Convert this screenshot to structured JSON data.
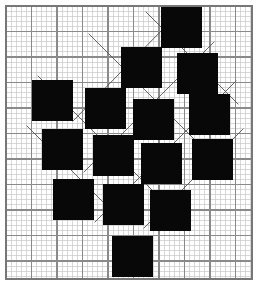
{
  "figure": {
    "width": 260,
    "height": 287,
    "background_color": "#ffffff"
  },
  "paper": {
    "name": "graph-paper",
    "left": 6,
    "top": 6,
    "right": 252,
    "bottom": 279,
    "minor_step": 5.1,
    "major_step": 25.5,
    "minor_color": "#c8c8c8",
    "major_color": "#8a8a8a",
    "border_color": "#777777",
    "minor_width": 0.7,
    "major_width": 1.1,
    "border_width": 1.2
  },
  "squares": {
    "name": "black-square",
    "fill_color": "#080808",
    "size": 41,
    "rotation_deg": 0,
    "count": 15,
    "items": [
      {
        "id": "sq-1",
        "x": 161,
        "y": 7,
        "size": 41
      },
      {
        "id": "sq-2",
        "x": 121,
        "y": 47,
        "size": 41
      },
      {
        "id": "sq-3",
        "x": 177,
        "y": 53,
        "size": 41
      },
      {
        "id": "sq-4",
        "x": 32,
        "y": 80,
        "size": 41
      },
      {
        "id": "sq-5",
        "x": 85,
        "y": 88,
        "size": 41
      },
      {
        "id": "sq-6",
        "x": 133,
        "y": 99,
        "size": 41
      },
      {
        "id": "sq-7",
        "x": 189,
        "y": 94,
        "size": 41
      },
      {
        "id": "sq-8",
        "x": 42,
        "y": 129,
        "size": 41
      },
      {
        "id": "sq-9",
        "x": 93,
        "y": 135,
        "size": 41
      },
      {
        "id": "sq-10",
        "x": 141,
        "y": 143,
        "size": 41
      },
      {
        "id": "sq-11",
        "x": 192,
        "y": 139,
        "size": 41
      },
      {
        "id": "sq-12",
        "x": 53,
        "y": 179,
        "size": 41
      },
      {
        "id": "sq-13",
        "x": 103,
        "y": 184,
        "size": 41
      },
      {
        "id": "sq-14",
        "x": 150,
        "y": 190,
        "size": 41
      },
      {
        "id": "sq-15",
        "x": 112,
        "y": 236,
        "size": 41
      }
    ]
  },
  "lattice_lines": {
    "name": "diagonal-lattice-line",
    "color": "#555555",
    "width": 0.9,
    "description": "Thin diagonal rules forming the tilted lattice between squares",
    "segments": [
      {
        "x1": 73,
        "y1": 121,
        "x2": 163,
        "y2": 29
      },
      {
        "x1": 84,
        "y1": 172,
        "x2": 214,
        "y2": 42
      },
      {
        "x1": 95,
        "y1": 222,
        "x2": 236,
        "y2": 81
      },
      {
        "x1": 144,
        "y1": 228,
        "x2": 243,
        "y2": 129
      },
      {
        "x1": 27,
        "y1": 126,
        "x2": 118,
        "y2": 217
      },
      {
        "x1": 38,
        "y1": 76,
        "x2": 170,
        "y2": 208
      },
      {
        "x1": 89,
        "y1": 34,
        "x2": 207,
        "y2": 152
      },
      {
        "x1": 146,
        "y1": 12,
        "x2": 238,
        "y2": 104
      }
    ]
  }
}
